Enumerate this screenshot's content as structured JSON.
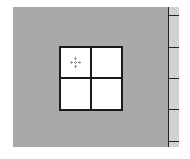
{
  "canvas": {
    "background": "#a9a9a9"
  },
  "ruler": {
    "background": "#d2d2d2",
    "tick_positions": [
      8,
      40,
      71,
      102,
      134
    ]
  },
  "grid": {
    "rows": 2,
    "cols": 2,
    "cell_color": "#ffffff",
    "line_color": "#1a1a1a"
  },
  "cursor": {
    "icon": "move-crosshair-icon"
  }
}
